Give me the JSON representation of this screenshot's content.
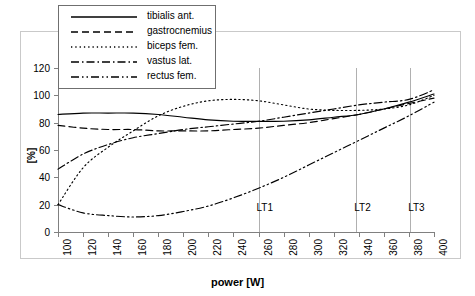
{
  "chart_data": {
    "type": "line",
    "title": "",
    "xlabel": "power [W]",
    "ylabel": "[%]",
    "xlim": [
      100,
      400
    ],
    "ylim": [
      0,
      120
    ],
    "xticks": [
      100,
      120,
      140,
      160,
      180,
      200,
      220,
      240,
      260,
      280,
      300,
      320,
      340,
      360,
      380,
      400
    ],
    "yticks": [
      0,
      20,
      40,
      60,
      80,
      100,
      120
    ],
    "grid": false,
    "legend_position": "top-left-inside",
    "x": [
      100,
      120,
      140,
      160,
      180,
      200,
      220,
      240,
      260,
      280,
      300,
      320,
      340,
      360,
      380,
      400
    ],
    "series": [
      {
        "name": "tibialis ant.",
        "dash": "solid",
        "values": [
          86,
          87,
          87,
          87,
          86,
          84,
          82,
          81,
          81,
          81,
          82,
          84,
          86,
          90,
          95,
          101
        ]
      },
      {
        "name": "gastrocnemius",
        "dash": "dashed",
        "values": [
          78,
          76,
          75,
          75,
          74,
          74,
          74,
          75,
          76,
          78,
          80,
          83,
          86,
          90,
          94,
          98
        ]
      },
      {
        "name": "biceps fem.",
        "dash": "dotted",
        "values": [
          20,
          47,
          62,
          74,
          85,
          92,
          96,
          97,
          96,
          93,
          90,
          89,
          89,
          90,
          93,
          100
        ]
      },
      {
        "name": "vastus lat.",
        "dash": "dash-dot",
        "values": [
          46,
          57,
          64,
          69,
          72,
          75,
          77,
          79,
          81,
          84,
          87,
          90,
          93,
          95,
          97,
          104
        ]
      },
      {
        "name": "rectus fem.",
        "dash": "dash-dot-dot",
        "values": [
          20,
          14,
          12,
          11,
          12,
          15,
          19,
          25,
          32,
          40,
          49,
          58,
          67,
          76,
          85,
          95
        ]
      }
    ],
    "annotations": [
      {
        "label": "LT1",
        "x": 260
      },
      {
        "label": "LT2",
        "x": 338
      },
      {
        "label": "LT3",
        "x": 381
      }
    ]
  },
  "colors": {
    "line": "#000000",
    "axis": "#808080",
    "threshold_line": "#b0b0b0",
    "frame": "#c9c9c9",
    "background": "#ffffff"
  }
}
